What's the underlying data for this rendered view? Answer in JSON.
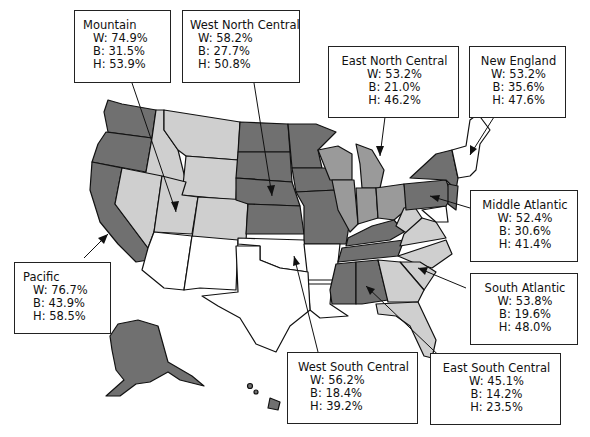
{
  "legend_keys": {
    "W": "W",
    "B": "B",
    "H": "H"
  },
  "colors": {
    "dark": "#707070",
    "medium": "#9a9a9a",
    "light": "#cfcfcf",
    "none": "#ffffff",
    "outline": "#111111"
  },
  "regions": {
    "mountain": {
      "name": "Mountain",
      "W": "W: 74.9%",
      "B": "B: 31.5%",
      "H": "H: 53.9%"
    },
    "west_north_central": {
      "name": "West North Central",
      "W": "W: 58.2%",
      "B": "B: 27.7%",
      "H": "H: 50.8%"
    },
    "east_north_central": {
      "name": "East North Central",
      "W": "W: 53.2%",
      "B": "B: 21.0%",
      "H": "H: 46.2%"
    },
    "new_england": {
      "name": "New England",
      "W": "W: 53.2%",
      "B": "B: 35.6%",
      "H": "H: 47.6%"
    },
    "middle_atlantic": {
      "name": "Middle Atlantic",
      "W": "W: 52.4%",
      "B": "B: 30.6%",
      "H": "H: 41.4%"
    },
    "south_atlantic": {
      "name": "South Atlantic",
      "W": "W: 53.8%",
      "B": "B: 19.6%",
      "H": "H: 48.0%"
    },
    "east_south_central": {
      "name": "East South Central",
      "W": "W: 45.1%",
      "B": "B: 14.2%",
      "H": "H: 23.5%"
    },
    "west_south_central": {
      "name": "West South Central",
      "W": "W: 56.2%",
      "B": "B: 18.4%",
      "H": "H: 39.2%"
    },
    "pacific": {
      "name": "Pacific",
      "W": "W: 76.7%",
      "B": "B: 43.9%",
      "H": "H: 58.5%"
    }
  }
}
